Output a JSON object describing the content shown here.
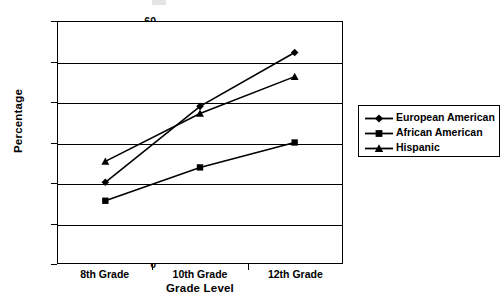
{
  "chart_data": {
    "type": "line",
    "title": "",
    "xlabel": "Grade Level",
    "ylabel": "Percentage",
    "categories": [
      "8th Grade",
      "10th Grade",
      "12th Grade"
    ],
    "series": [
      {
        "name": "European American",
        "marker": "diamond",
        "values": [
          20.1,
          39.0,
          52.4
        ]
      },
      {
        "name": "African American",
        "marker": "square",
        "values": [
          15.5,
          23.8,
          30.0
        ]
      },
      {
        "name": "Hispanic",
        "marker": "triangle",
        "values": [
          25.3,
          37.2,
          46.4
        ]
      }
    ],
    "ylim": [
      0,
      60
    ],
    "yticks": [
      60,
      50,
      40,
      30,
      20,
      10,
      0
    ],
    "ytick_labels": [
      "60",
      "50",
      "40",
      "30",
      "20",
      "10",
      "0"
    ],
    "grid": true,
    "legend_position": "right",
    "line_color": "#000000",
    "background_color": "#ffffff"
  },
  "legend": {
    "entries": [
      {
        "label": "European American",
        "marker": "diamond-marker"
      },
      {
        "label": "African American",
        "marker": "square-marker"
      },
      {
        "label": "Hispanic",
        "marker": "triangle-marker"
      }
    ]
  }
}
